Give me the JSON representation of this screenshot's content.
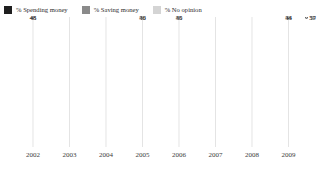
{
  "legend": {
    "items": [
      {
        "label": "% Spending money",
        "color": "#1f1f1f",
        "icon": "square-swatch-icon"
      },
      {
        "label": "% Saving money",
        "color": "#8a8a8a",
        "icon": "square-swatch-icon"
      },
      {
        "label": "% No opinion",
        "color": "#d4d4d4",
        "icon": "square-swatch-icon"
      }
    ]
  },
  "chart_data": {
    "type": "line",
    "title": "",
    "xlabel": "",
    "ylabel": "",
    "ylim": [
      0,
      65
    ],
    "grid": "vertical",
    "legend_position": "top-left",
    "x": [
      "2002",
      "2003",
      "2004",
      "2005",
      "2006",
      "2007",
      "2008",
      "2009",
      "2009b"
    ],
    "categories": [
      "2002",
      "2003",
      "2004",
      "2005",
      "2006",
      "2007",
      "2008",
      "2009"
    ],
    "series": [
      {
        "name": "% Saving money",
        "color": "#8a8a8a",
        "points": [
          {
            "x": "2002",
            "value": 48,
            "label": "48",
            "labeled": true
          },
          {
            "x": "2005",
            "value": 50,
            "label": "50",
            "labeled": true
          },
          {
            "x": "2006",
            "value": 50,
            "label": "50",
            "labeled": true
          },
          {
            "x": "2009",
            "value": 53,
            "label": "53",
            "labeled": true
          },
          {
            "x": "2009b",
            "value": 59,
            "label": "59",
            "labeled": true
          }
        ]
      },
      {
        "name": "% Spending money",
        "color": "#1f1f1f",
        "points": [
          {
            "x": "2002",
            "value": 45,
            "label": "45",
            "labeled": true
          },
          {
            "x": "2005",
            "value": 46,
            "label": "46",
            "labeled": true
          },
          {
            "x": "2006",
            "value": 45,
            "label": "45",
            "labeled": true
          },
          {
            "x": "2009",
            "value": 44,
            "label": "44",
            "labeled": true
          },
          {
            "x": "2009b",
            "value": 37,
            "label": "37",
            "labeled": true
          }
        ]
      },
      {
        "name": "% No opinion",
        "color": "#d0d0d0",
        "points": [
          {
            "x": "2002",
            "value": 7,
            "label": "7",
            "labeled": true
          },
          {
            "x": "2005",
            "value": 4,
            "label": "4",
            "labeled": true
          },
          {
            "x": "2006",
            "value": 4,
            "label": "4",
            "labeled": true
          },
          {
            "x": "2009",
            "value": 3,
            "label": "3",
            "labeled": true
          },
          {
            "x": "2009b",
            "value": 4,
            "label": "4",
            "labeled": true
          }
        ]
      }
    ]
  }
}
